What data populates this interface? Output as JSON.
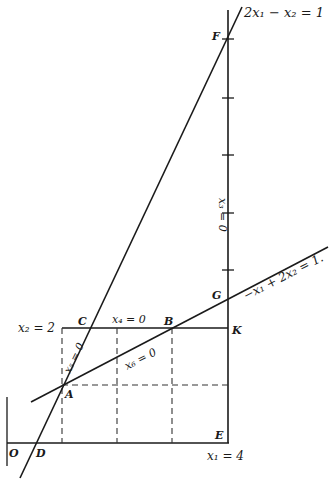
{
  "diagram": {
    "type": "linear-programming-feasible-region",
    "colors": {
      "ink": "#1a1a1a",
      "background": "#ffffff"
    },
    "points": {
      "O": "O",
      "D": "D",
      "A": "A",
      "C": "C",
      "B": "B",
      "K": "K",
      "G": "G",
      "F": "F",
      "E": "E"
    },
    "constraint_labels": {
      "line_steep": "2x₁ − x₂ = 1",
      "line_shallow": "−x₁ + 2x₂ = 1.",
      "x2_bound": "x₂ = 2",
      "x1_bound": "x₁ = 4",
      "x3_zero": "x₃ = 0",
      "x4_zero": "x₄ = 0",
      "x5_zero": "x₅ = 0",
      "x6_zero": "x₆ = 0"
    },
    "tick_count_right_axis": 5
  }
}
